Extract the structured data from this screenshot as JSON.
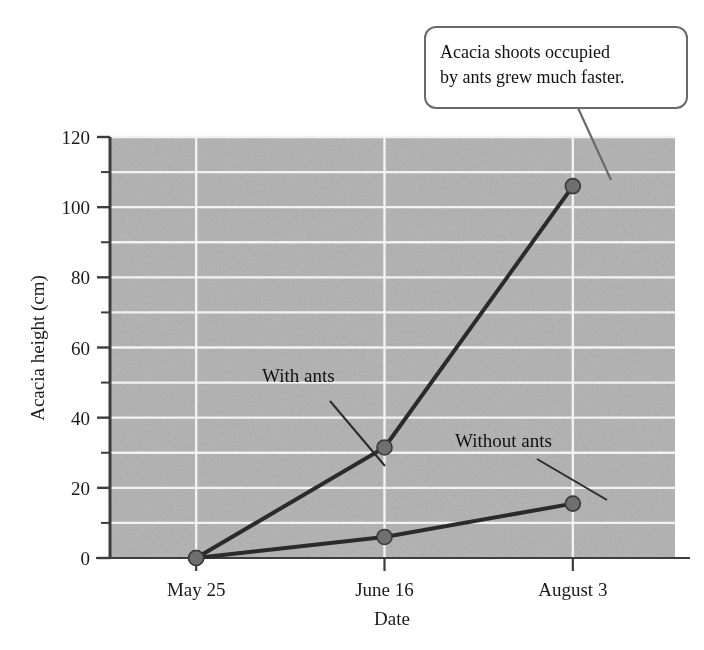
{
  "chart_data": {
    "type": "line",
    "title": "",
    "xlabel": "Date",
    "ylabel": "Acacia height  (cm)",
    "categories": [
      "May 25",
      "June 16",
      "August 3"
    ],
    "series": [
      {
        "name": "With ants",
        "values": [
          0,
          31.5,
          106
        ]
      },
      {
        "name": "Without ants",
        "values": [
          0,
          6,
          15.5
        ]
      }
    ],
    "ylim": [
      0,
      120
    ],
    "ytick_labels": [
      "0",
      "20",
      "40",
      "60",
      "80",
      "100",
      "120"
    ],
    "ytick_values": [
      0,
      20,
      40,
      60,
      80,
      100,
      120
    ],
    "yminor_step": 10,
    "grid": "horizontal-and-vertical",
    "legend": "inline-annotations",
    "annotations": [
      {
        "text": "With ants",
        "target_series": "With ants",
        "target_category": "June 16"
      },
      {
        "text": "Without ants",
        "target_series": "Without ants",
        "target_category": "August 3"
      }
    ],
    "callout": {
      "line1": "Acacia shoots occupied",
      "line2": "by ants grew much faster.",
      "target_series": "With ants",
      "target_category": "August 3"
    },
    "colors": {
      "plot_background": "#b6b6b6",
      "gridline": "#f2f2f2",
      "series_line": "#2b2b2b",
      "marker_fill": "#6f6f6f",
      "marker_stroke": "#3a3a3a",
      "axis": "#3d3d3d",
      "callout_border": "#6a6a6a",
      "callout_fill": "#ffffff",
      "text": "#1a1a1a"
    }
  }
}
